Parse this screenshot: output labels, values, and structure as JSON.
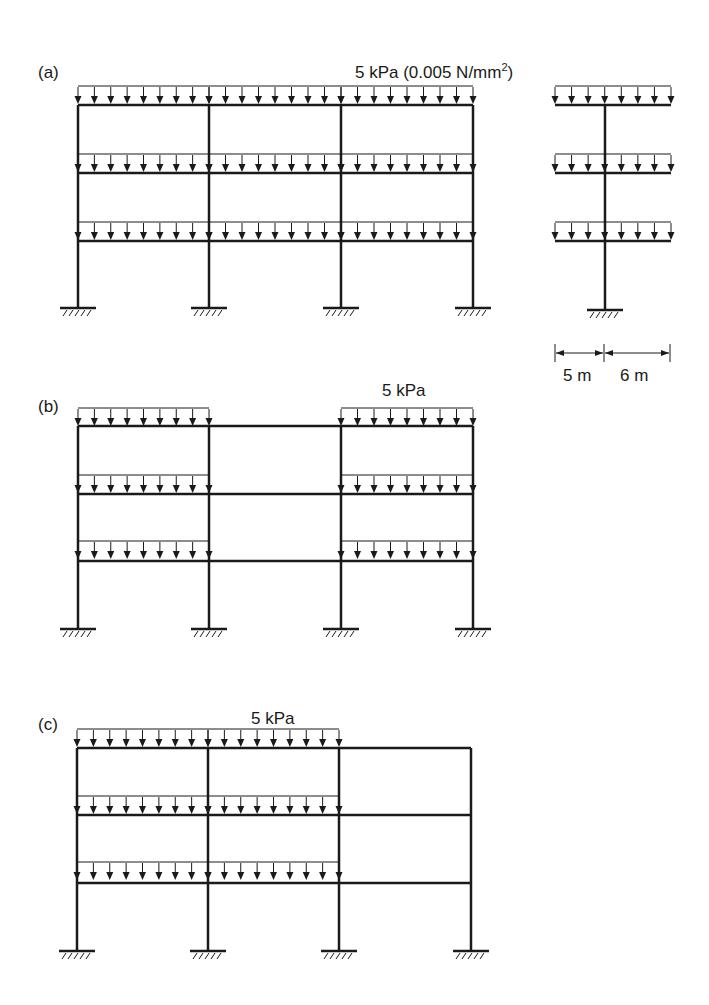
{
  "figure": {
    "panels": [
      {
        "id": "a",
        "label": "(a)",
        "load_label": "5 kPa (0.005 N/mm",
        "load_label_sup": "2",
        "load_label_close": ")",
        "description": "Three-bay, three-storey frame with full uniform load on all bays at every floor"
      },
      {
        "id": "b",
        "label": "(b)",
        "load_label": "5 kPa",
        "description": "Checkerboard loading: outer two bays loaded, middle bay unloaded at every floor"
      },
      {
        "id": "c",
        "label": "(c)",
        "load_label": "5 kPa",
        "description": "Left two bays loaded, right bay unloaded at every floor"
      }
    ],
    "side_view": {
      "description": "Side elevation: single column with beams cantilevering each side, loaded at every floor",
      "dimensions": [
        "5 m",
        "6 m"
      ]
    },
    "colors": {
      "line": "#1a1a1a",
      "background": "#ffffff"
    }
  }
}
